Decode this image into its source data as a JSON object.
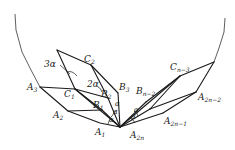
{
  "figure": {
    "labels": {
      "A1": {
        "main": "A",
        "sub": "1"
      },
      "A2": {
        "main": "A",
        "sub": "2"
      },
      "A3": {
        "main": "A",
        "sub": "3"
      },
      "A2n": {
        "main": "A",
        "sub": "2n"
      },
      "A2n_1": {
        "main": "A",
        "sub": "2n−1"
      },
      "A2n_2": {
        "main": "A",
        "sub": "2n−2"
      },
      "B1": {
        "main": "B",
        "sub": "1"
      },
      "B2": {
        "main": "B",
        "sub": "2"
      },
      "B3": {
        "main": "B",
        "sub": "3"
      },
      "Bn_2": {
        "main": "B",
        "sub": "n−2"
      },
      "C1": {
        "main": "C",
        "sub": "1"
      },
      "C2": {
        "main": "C",
        "sub": "2"
      },
      "Cn_3": {
        "main": "C",
        "sub": "n−3"
      }
    },
    "angles": {
      "three_alpha": "3α",
      "two_alpha": "2α",
      "alpha": "α"
    }
  }
}
